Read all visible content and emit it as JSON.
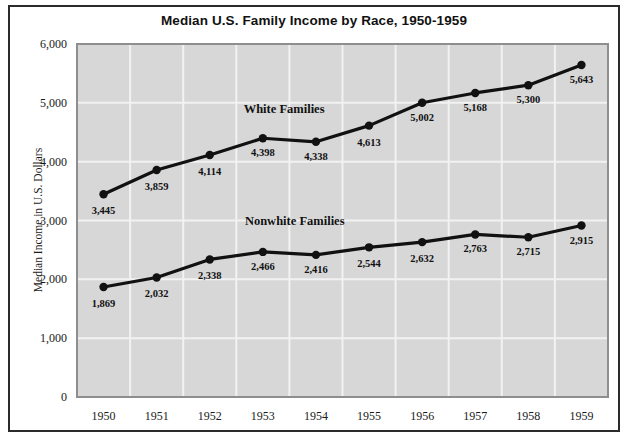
{
  "chart_data": {
    "type": "line",
    "title": "Median U.S. Family Income by Race, 1950-1959",
    "xlabel": "",
    "ylabel": "Median Income in U.S. Dollars",
    "categories": [
      "1950",
      "1951",
      "1952",
      "1953",
      "1954",
      "1955",
      "1956",
      "1957",
      "1958",
      "1959"
    ],
    "ylim": [
      0,
      6000
    ],
    "ytick_labels": [
      "6,000",
      "5,000",
      "4,000",
      "3,000",
      "2,000",
      "1,000",
      "0"
    ],
    "ytick_values": [
      6000,
      5000,
      4000,
      3000,
      2000,
      1000,
      0
    ],
    "grid": true,
    "legend_position": "inline-annotation",
    "series": [
      {
        "name": "White Families",
        "values": [
          3445,
          3859,
          4114,
          4398,
          4338,
          4613,
          5002,
          5168,
          5300,
          5643
        ],
        "labels": [
          "3,445",
          "3,859",
          "4,114",
          "4,398",
          "4,338",
          "4,613",
          "5,002",
          "5,168",
          "5,300",
          "5,643"
        ],
        "color": "#111111"
      },
      {
        "name": "Nonwhite Families",
        "values": [
          1869,
          2032,
          2338,
          2466,
          2416,
          2544,
          2632,
          2763,
          2715,
          2915
        ],
        "labels": [
          "1,869",
          "2,032",
          "2,338",
          "2,466",
          "2,416",
          "2,544",
          "2,632",
          "2,763",
          "2,715",
          "2,915"
        ],
        "color": "#111111"
      }
    ],
    "annotations": [
      {
        "text": "White Families",
        "x_value": 1953.4,
        "y_value": 4830
      },
      {
        "text": "Nonwhite Families",
        "x_value": 1953.6,
        "y_value": 2930
      }
    ],
    "style": {
      "plot_background": "#d7d7d7",
      "gridline_color": "#f2f2f2",
      "frame_color": "#2b2b2b",
      "page_background": "#ffffff"
    }
  },
  "footer": {
    "cut_text": ""
  }
}
